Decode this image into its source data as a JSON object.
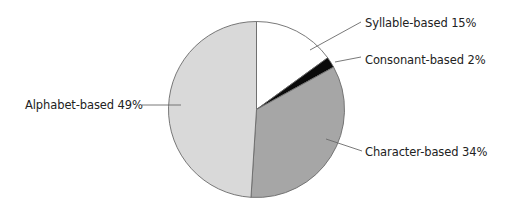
{
  "chart_data": {
    "type": "pie",
    "title": "",
    "slices": [
      {
        "label": "Syllable-based",
        "value": 15,
        "color": "#ffffff"
      },
      {
        "label": "Consonant-based",
        "value": 2,
        "color": "#0a0a0a"
      },
      {
        "label": "Character-based",
        "value": 34,
        "color": "#a6a6a6"
      },
      {
        "label": "Alphabet-based",
        "value": 49,
        "color": "#d9d9d9"
      }
    ],
    "start_angle_deg": 0,
    "direction": "clockwise",
    "legend": "none",
    "labels_position": "outside-with-leader-lines"
  },
  "labels": {
    "syllable": "Syllable-based 15%",
    "consonant": "Consonant-based 2%",
    "character": "Character-based 34%",
    "alphabet": "Alphabet-based 49%"
  }
}
